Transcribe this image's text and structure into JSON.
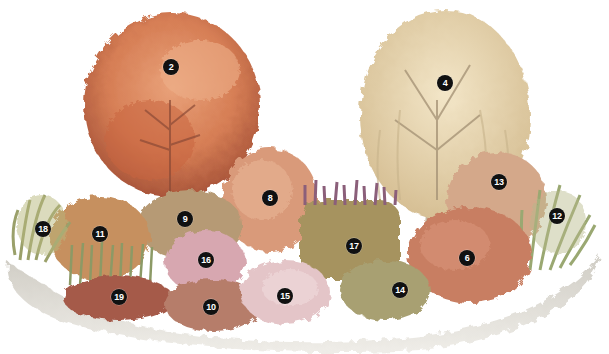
{
  "illustration": {
    "subject": "planted garden border with two trees, shrubs, grasses and perennials",
    "colors": {
      "background": "#ffffff",
      "ground": "#d9d6cf",
      "tree2_foliage": "#d9835a",
      "tree2_dark": "#b35a3a",
      "tree4_foliage": "#e6d2a8",
      "tree4_trunk": "#b8aa90",
      "shrub_green": "#8a9a5b",
      "shrub_orange": "#d88a5c",
      "shrub_pink": "#d9a0a0",
      "shrub_red": "#b8524a",
      "grass": "#9aa872",
      "marker": "#111111"
    },
    "markers": [
      {
        "label": "2",
        "x": 171,
        "y": 67
      },
      {
        "label": "4",
        "x": 445,
        "y": 83
      },
      {
        "label": "13",
        "x": 499,
        "y": 182
      },
      {
        "label": "8",
        "x": 270,
        "y": 198
      },
      {
        "label": "12",
        "x": 557,
        "y": 216
      },
      {
        "label": "9",
        "x": 185,
        "y": 219
      },
      {
        "label": "18",
        "x": 43,
        "y": 229
      },
      {
        "label": "11",
        "x": 100,
        "y": 234
      },
      {
        "label": "17",
        "x": 354,
        "y": 246
      },
      {
        "label": "6",
        "x": 467,
        "y": 258
      },
      {
        "label": "16",
        "x": 206,
        "y": 260
      },
      {
        "label": "14",
        "x": 400,
        "y": 290
      },
      {
        "label": "15",
        "x": 285,
        "y": 296
      },
      {
        "label": "19",
        "x": 119,
        "y": 297
      },
      {
        "label": "10",
        "x": 211,
        "y": 307
      }
    ]
  }
}
